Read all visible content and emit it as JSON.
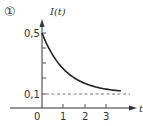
{
  "figure": {
    "marker": "①",
    "colors": {
      "axis": "#333333",
      "curve": "#222222",
      "dashed": "#555555"
    }
  },
  "chart_data": {
    "type": "line",
    "title": "",
    "xlabel": "t",
    "ylabel": "I(t)",
    "xlim": [
      0,
      4.3
    ],
    "ylim": [
      0,
      0.57
    ],
    "x_ticks": [
      0,
      1,
      2,
      3
    ],
    "x_tick_labels": [
      "0",
      "1",
      "2",
      "3"
    ],
    "y_ticks": [
      0.1,
      0.2,
      0.3,
      0.4,
      0.5
    ],
    "y_tick_labels": [
      "0,1",
      "",
      "",
      "",
      "0,5"
    ],
    "grid": false,
    "legend": null,
    "series": [
      {
        "name": "I(t)",
        "style": "solid",
        "x": [
          0,
          0.25,
          0.5,
          0.75,
          1,
          1.5,
          2,
          2.5,
          3,
          3.5,
          3.7
        ],
        "values": [
          0.5,
          0.433,
          0.38,
          0.335,
          0.3,
          0.24,
          0.19,
          0.16,
          0.135,
          0.118,
          0.112
        ]
      },
      {
        "name": "asymptote",
        "style": "dashed",
        "x": [
          0,
          4.0
        ],
        "values": [
          0.1,
          0.1
        ]
      }
    ],
    "annotations": [
      "asymptote I = 0,1 (dashed)"
    ]
  }
}
